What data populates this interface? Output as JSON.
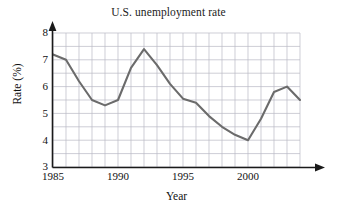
{
  "chart_data": {
    "type": "line",
    "title": "U.S. unemployment rate",
    "xlabel": "Year",
    "ylabel": "Rate (%)",
    "xlim": [
      1985,
      2004
    ],
    "ylim": [
      3,
      8
    ],
    "xticks": [
      1985,
      1990,
      1995,
      2000
    ],
    "yticks": [
      3,
      4,
      5,
      6,
      7,
      8
    ],
    "grid": true,
    "grid_x_step": 1,
    "grid_y_step": 0.5,
    "legend": null,
    "line_color": "#6b6b6b",
    "x": [
      1985,
      1986,
      1987,
      1988,
      1989,
      1990,
      1991,
      1992,
      1993,
      1994,
      1995,
      1996,
      1997,
      1998,
      1999,
      2000,
      2001,
      2002,
      2003,
      2004
    ],
    "values": [
      7.2,
      7.0,
      6.2,
      5.5,
      5.3,
      5.5,
      6.7,
      7.4,
      6.8,
      6.1,
      5.55,
      5.4,
      4.9,
      4.5,
      4.2,
      4.0,
      4.8,
      5.8,
      6.0,
      5.5
    ],
    "series": [
      {
        "name": "U.S. unemployment rate",
        "values": [
          7.2,
          7.0,
          6.2,
          5.5,
          5.3,
          5.5,
          6.7,
          7.4,
          6.8,
          6.1,
          5.55,
          5.4,
          4.9,
          4.5,
          4.2,
          4.0,
          4.8,
          5.8,
          6.0,
          5.5
        ]
      }
    ]
  },
  "ytick_labels": [
    "8",
    "7",
    "6",
    "5",
    "4",
    "3"
  ],
  "xtick_labels": [
    "1985",
    "1990",
    "1995",
    "2000"
  ]
}
